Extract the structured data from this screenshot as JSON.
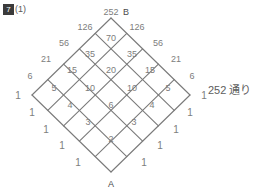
{
  "problem": {
    "number": "7",
    "sub_label": "(1)"
  },
  "answer": {
    "text": "252 通り"
  },
  "diagram": {
    "type": "lattice-path-count",
    "start_vertex_label": "A",
    "end_vertex_label": "B",
    "grid_size": 5,
    "total_paths": "252",
    "nodes": [
      {
        "value": "252",
        "x": 111,
        "y": 12,
        "role": "apex"
      },
      {
        "value": "126",
        "x": 85,
        "y": 27
      },
      {
        "value": "126",
        "x": 137,
        "y": 27
      },
      {
        "value": "56",
        "x": 64,
        "y": 43
      },
      {
        "value": "70",
        "x": 111,
        "y": 38
      },
      {
        "value": "56",
        "x": 158,
        "y": 43
      },
      {
        "value": "21",
        "x": 46,
        "y": 59
      },
      {
        "value": "35",
        "x": 90,
        "y": 54
      },
      {
        "value": "35",
        "x": 132,
        "y": 54
      },
      {
        "value": "21",
        "x": 176,
        "y": 59
      },
      {
        "value": "6",
        "x": 30,
        "y": 76
      },
      {
        "value": "15",
        "x": 72,
        "y": 70
      },
      {
        "value": "20",
        "x": 111,
        "y": 70
      },
      {
        "value": "15",
        "x": 150,
        "y": 70
      },
      {
        "value": "6",
        "x": 192,
        "y": 76
      },
      {
        "value": "1",
        "x": 18,
        "y": 95
      },
      {
        "value": "5",
        "x": 54,
        "y": 88
      },
      {
        "value": "10",
        "x": 90,
        "y": 88
      },
      {
        "value": "10",
        "x": 132,
        "y": 88
      },
      {
        "value": "5",
        "x": 168,
        "y": 88
      },
      {
        "value": "1",
        "x": 204,
        "y": 95
      },
      {
        "value": "1",
        "x": 32,
        "y": 112
      },
      {
        "value": "4",
        "x": 70,
        "y": 105
      },
      {
        "value": "6",
        "x": 111,
        "y": 105
      },
      {
        "value": "4",
        "x": 152,
        "y": 105
      },
      {
        "value": "1",
        "x": 190,
        "y": 112
      },
      {
        "value": "1",
        "x": 46,
        "y": 129
      },
      {
        "value": "3",
        "x": 88,
        "y": 122
      },
      {
        "value": "3",
        "x": 134,
        "y": 122
      },
      {
        "value": "1",
        "x": 176,
        "y": 129
      },
      {
        "value": "1",
        "x": 62,
        "y": 145
      },
      {
        "value": "2",
        "x": 111,
        "y": 139
      },
      {
        "value": "1",
        "x": 160,
        "y": 145
      },
      {
        "value": "1",
        "x": 78,
        "y": 162
      },
      {
        "value": "1",
        "x": 144,
        "y": 162
      }
    ],
    "vertices": [
      {
        "label": "B",
        "x": 126,
        "y": 12
      },
      {
        "label": "A",
        "x": 111,
        "y": 184
      }
    ],
    "geometry": {
      "center_x": 111,
      "top_y": 18,
      "bottom_y": 172,
      "left_x": 32,
      "right_x": 190,
      "divisions": 5,
      "line_color": "#7a7a7a",
      "line_width": 1.1
    }
  }
}
